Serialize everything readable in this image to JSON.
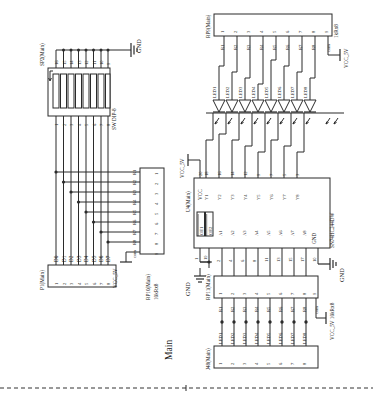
{
  "sheet": {
    "title": "Main",
    "orientation": "rotated-90",
    "background": "#ffffff",
    "line_color": "#2b2b2b"
  },
  "components": {
    "sp2": {
      "ref": "SP2(Main)",
      "type": "SW DIP-8",
      "bottom_pins": [
        "1",
        "2",
        "3",
        "4",
        "5",
        "6",
        "7",
        "8"
      ],
      "top_pins": [
        "16",
        "15",
        "14",
        "13",
        "12",
        "11",
        "10",
        "9"
      ],
      "net_top": "GND"
    },
    "p1": {
      "ref": "P1(Main)",
      "pins": [
        "1",
        "2",
        "3",
        "4",
        "5",
        "6",
        "7",
        "8"
      ],
      "signals": [
        "D0",
        "D1",
        "D2",
        "D3",
        "D4",
        "D5",
        "D6",
        "D7"
      ]
    },
    "rp10": {
      "ref": "RP10(Main)",
      "value": "10kRx8",
      "pins": [
        "1",
        "2",
        "3",
        "4",
        "5",
        "6",
        "7",
        "8",
        "9"
      ],
      "labels": [
        "R1",
        "R2",
        "R3",
        "R4",
        "R5",
        "R6",
        "R7",
        "R8",
        "com"
      ],
      "com_net": "VCC_5V"
    },
    "rp9": {
      "ref": "RP9(Main)",
      "value": "1kRx8",
      "pins": [
        "1",
        "2",
        "3",
        "4",
        "5",
        "6",
        "7",
        "8",
        "9"
      ],
      "labels": [
        "R1",
        "R2",
        "R3",
        "R4",
        "R5",
        "R6",
        "R7",
        "R8",
        "com"
      ],
      "com_net": "VCC_5V"
    },
    "leds": {
      "refs": [
        "LED1",
        "LED2",
        "LED3",
        "LED4",
        "LED5",
        "LED6",
        "LED7",
        "LED8"
      ]
    },
    "u4": {
      "ref": "U4(Main)",
      "part": "SN74HC244DW",
      "enable_pins": [
        {
          "name": "OE1",
          "pin": "1",
          "overline": true
        },
        {
          "name": "OE2",
          "pin": "19",
          "overline": true
        }
      ],
      "inputs": [
        {
          "name": "A1",
          "pin": "2"
        },
        {
          "name": "A2",
          "pin": "4"
        },
        {
          "name": "A3",
          "pin": "6"
        },
        {
          "name": "A4",
          "pin": "8"
        },
        {
          "name": "A5",
          "pin": "11"
        },
        {
          "name": "A6",
          "pin": "13"
        },
        {
          "name": "A7",
          "pin": "15"
        },
        {
          "name": "A8",
          "pin": "17"
        }
      ],
      "outputs": [
        {
          "name": "Y1",
          "pin": "18"
        },
        {
          "name": "Y2",
          "pin": "16"
        },
        {
          "name": "Y3",
          "pin": "14"
        },
        {
          "name": "Y4",
          "pin": "12"
        },
        {
          "name": "Y5",
          "pin": "9"
        },
        {
          "name": "Y6",
          "pin": "7"
        },
        {
          "name": "Y7",
          "pin": "5"
        },
        {
          "name": "Y8",
          "pin": "3"
        }
      ],
      "power": [
        {
          "name": "VCC",
          "pin": "20",
          "net": "VCC_5V"
        },
        {
          "name": "GND",
          "pin": "10",
          "net": "GND"
        }
      ]
    },
    "rp11": {
      "ref": "RP11(Main)",
      "value": "10kRx8",
      "pins": [
        "1",
        "2",
        "3",
        "4",
        "5",
        "6",
        "7",
        "8",
        "9"
      ],
      "labels": [
        "R1",
        "R2",
        "R3",
        "R4",
        "R5",
        "R6",
        "R7",
        "R8",
        "com"
      ],
      "com_net": "VCC_5V 10kRx8"
    },
    "j48": {
      "ref": "J48(Main)",
      "pins": [
        "1",
        "2",
        "3",
        "4",
        "5",
        "6",
        "7",
        "8"
      ],
      "signals": [
        "LED1",
        "LED2",
        "LED3",
        "LED4",
        "LED5",
        "LED6",
        "LED7",
        "LED8"
      ]
    }
  },
  "nets": {
    "gnd": "GND",
    "vcc": "VCC_5V"
  }
}
